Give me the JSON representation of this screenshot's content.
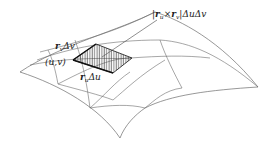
{
  "diagram": {
    "type": "parametric-surface-area-element",
    "labels": {
      "area_element": {
        "r": "r",
        "u": "u",
        "times": "×",
        "r2": "r",
        "v": "v",
        "rest": "|ΔuΔv",
        "open": "|"
      },
      "rv_dv": {
        "r": "r",
        "sub": "v",
        "rest": "Δv"
      },
      "ru_du": {
        "r": "r",
        "sub": "u",
        "rest": "Δu"
      },
      "point": "(u,v)"
    },
    "colors": {
      "line": "#6b6b6b",
      "edge": "#111111",
      "hatch": "#333333",
      "background": "#ffffff"
    }
  }
}
